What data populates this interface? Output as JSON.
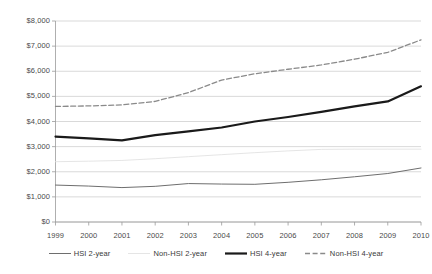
{
  "chart_data": {
    "type": "line",
    "title": "",
    "subtitle": "",
    "xlabel": "",
    "ylabel": "",
    "categories": [
      "1999",
      "2000",
      "2001",
      "2002",
      "2003",
      "2004",
      "2005",
      "2006",
      "2007",
      "2008",
      "2009",
      "2010"
    ],
    "x": [
      1999,
      2000,
      2001,
      2002,
      2003,
      2004,
      2005,
      2006,
      2007,
      2008,
      2009,
      2010
    ],
    "ylim": [
      0,
      8000
    ],
    "ytick_values": [
      0,
      1000,
      2000,
      3000,
      4000,
      5000,
      6000,
      7000,
      8000
    ],
    "ytick_labels": [
      "$0",
      "$1,000",
      "$2,000",
      "$3,000",
      "$4,000",
      "$5,000",
      "$6,000",
      "$7,000",
      "$8,000"
    ],
    "grid": true,
    "grid_axis": "y",
    "legend_position": "bottom",
    "series": [
      {
        "name": "HSI 2-year",
        "values": [
          1470,
          1430,
          1370,
          1420,
          1530,
          1510,
          1500,
          1580,
          1680,
          1800,
          1930,
          2150
        ],
        "color": "#6e6e6e",
        "style": "solid",
        "width": 1.0
      },
      {
        "name": "Non-HSI 2-year",
        "values": [
          2400,
          2420,
          2450,
          2520,
          2600,
          2680,
          2760,
          2830,
          2890,
          2900,
          2900,
          2900
        ],
        "color": "#e2e2e2",
        "style": "solid",
        "width": 0.9
      },
      {
        "name": "HSI 4-year",
        "values": [
          3400,
          3330,
          3250,
          3460,
          3610,
          3760,
          4000,
          4180,
          4380,
          4600,
          4800,
          5400
        ],
        "color": "#1a1a1a",
        "style": "solid",
        "width": 2.2
      },
      {
        "name": "Non-HSI 4-year",
        "values": [
          4600,
          4620,
          4660,
          4800,
          5150,
          5650,
          5900,
          6080,
          6250,
          6480,
          6750,
          7250
        ],
        "color": "#8a8a8a",
        "style": "dashed",
        "width": 1.3
      }
    ]
  },
  "legend": {
    "items": [
      {
        "label": "HSI 2-year"
      },
      {
        "label": "Non-HSI 2-year"
      },
      {
        "label": "HSI 4-year"
      },
      {
        "label": "Non-HSI 4-year"
      }
    ]
  }
}
